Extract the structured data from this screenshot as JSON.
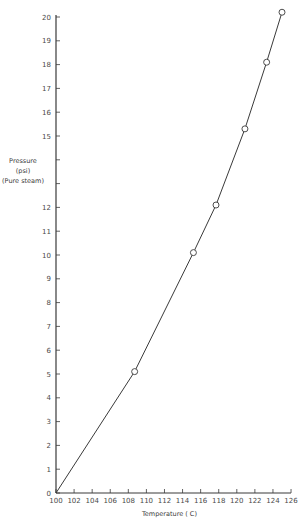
{
  "chart_data": {
    "type": "line",
    "title": "",
    "xlabel": "Temperature ( C)",
    "ylabel": [
      "Pressure",
      "(psi)",
      "(Pure steam)"
    ],
    "xlim": [
      100,
      126
    ],
    "ylim": [
      0,
      20
    ],
    "x_ticks": [
      100,
      102,
      104,
      106,
      108,
      110,
      112,
      114,
      116,
      118,
      120,
      122,
      124,
      126
    ],
    "y_ticks": [
      0,
      1,
      2,
      3,
      4,
      5,
      6,
      7,
      8,
      9,
      10,
      11,
      12,
      13,
      14,
      15,
      16,
      17,
      18,
      19,
      20
    ],
    "y_tick_labels": [
      "0",
      "1",
      "2",
      "3",
      "4",
      "5",
      "6",
      "7",
      "8",
      "9",
      "10",
      "11",
      "12",
      "",
      "",
      "15",
      "16",
      "17",
      "18",
      "19",
      "20"
    ],
    "grid": false,
    "legend": null,
    "series": [
      {
        "name": "Pure steam pressure",
        "line_points": [
          {
            "x": 100,
            "y": 0
          },
          {
            "x": 108.7,
            "y": 5.1
          },
          {
            "x": 115.2,
            "y": 10.1
          },
          {
            "x": 117.7,
            "y": 12.1
          },
          {
            "x": 120.9,
            "y": 15.3
          },
          {
            "x": 123.3,
            "y": 18.1
          },
          {
            "x": 125.0,
            "y": 20.2
          }
        ],
        "markers": [
          {
            "x": 108.7,
            "y": 5.1
          },
          {
            "x": 115.2,
            "y": 10.1
          },
          {
            "x": 117.7,
            "y": 12.1
          },
          {
            "x": 120.9,
            "y": 15.3
          },
          {
            "x": 123.3,
            "y": 18.1
          },
          {
            "x": 125.0,
            "y": 20.2
          }
        ],
        "marker_style": "open-circle",
        "color": "#3a3a3a"
      }
    ]
  },
  "layout": {
    "origin_px": [
      56,
      493
    ],
    "x_px_per_unit": 9.04,
    "y_px_per_unit": 23.8
  }
}
